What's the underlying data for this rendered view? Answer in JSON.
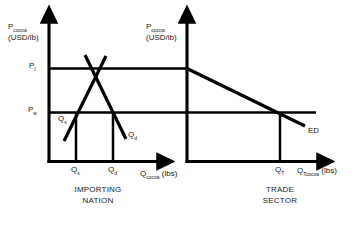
{
  "figure": {
    "type": "economics-diagram",
    "line_color": "#000000",
    "background_color": "#ffffff",
    "text_color": "#1a1a1a"
  },
  "left_panel": {
    "name": "IMPORTING NATION",
    "y_axis": {
      "label_main": "P",
      "label_sub": "cocoa",
      "units": "(USD/lb)"
    },
    "x_axis": {
      "label_main": "Q",
      "label_sub": "cocoa",
      "units": "(lbs)"
    },
    "price_levels": [
      {
        "id": "pi",
        "label_main": "P",
        "label_sub": "I",
        "meaning": "autarky price"
      },
      {
        "id": "pw",
        "label_main": "P",
        "label_sub": "w",
        "meaning": "world price"
      }
    ],
    "quantities": [
      {
        "id": "qs",
        "label_main": "Q",
        "label_sub": "s",
        "meaning": "quantity supplied at world price"
      },
      {
        "id": "qd",
        "label_main": "Q",
        "label_sub": "d",
        "meaning": "quantity demanded at world price"
      }
    ],
    "curves": [
      {
        "id": "supply",
        "label_main": "Q",
        "label_sub": "s",
        "slope": "upward"
      },
      {
        "id": "demand",
        "label_main": "Q",
        "label_sub": "d",
        "slope": "downward"
      }
    ]
  },
  "right_panel": {
    "name": "TRADE SECTOR",
    "y_axis": {
      "label_main": "P",
      "label_sub": "cocoa",
      "units": "(USD/lb)"
    },
    "x_axis": {
      "label_main": "Q",
      "label_sub": "Tcocoa",
      "units": "(lbs)"
    },
    "quantities": [
      {
        "id": "qt",
        "label_main": "Q",
        "label_sub": "T",
        "meaning": "trade quantity at world price"
      }
    ],
    "curves": [
      {
        "id": "ed",
        "label": "ED",
        "meaning": "excess demand",
        "slope": "downward"
      }
    ]
  },
  "chart_data": {
    "type": "line",
    "title": "",
    "panels": [
      {
        "name": "IMPORTING NATION",
        "xlabel": "Q_cocoa (lbs)",
        "ylabel": "P_cocoa (USD/lb)",
        "grid": false,
        "legend": "inline-curve-labels",
        "xlim": [
          0,
          100
        ],
        "ylim": [
          0,
          100
        ],
        "reference_lines": [
          {
            "name": "P_I",
            "axis": "horizontal",
            "value": 66
          },
          {
            "name": "P_w",
            "axis": "horizontal",
            "value": 36
          },
          {
            "name": "Q_s",
            "axis": "vertical",
            "value": 25
          },
          {
            "name": "Q_d",
            "axis": "vertical",
            "value": 50
          }
        ],
        "series": [
          {
            "name": "Q_s",
            "x": [
              14,
              52
            ],
            "y": [
              13,
              78
            ]
          },
          {
            "name": "Q_d",
            "x": [
              33,
              62
            ],
            "y": [
              80,
              15
            ]
          }
        ],
        "equilibrium": {
          "x": 38,
          "y": 66
        }
      },
      {
        "name": "TRADE SECTOR",
        "xlabel": "Q_Tcocoa (lbs)",
        "ylabel": "P_cocoa (USD/lb)",
        "grid": false,
        "legend": "inline-curve-labels",
        "xlim": [
          0,
          100
        ],
        "ylim": [
          0,
          100
        ],
        "reference_lines": [
          {
            "name": "P_I",
            "axis": "horizontal",
            "value": 66
          },
          {
            "name": "P_w",
            "axis": "horizontal",
            "value": 36
          },
          {
            "name": "Q_T",
            "axis": "vertical",
            "value": 74
          }
        ],
        "series": [
          {
            "name": "ED",
            "x": [
              0,
              88
            ],
            "y": [
              66,
              26
            ]
          }
        ]
      }
    ]
  }
}
